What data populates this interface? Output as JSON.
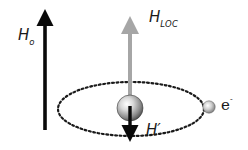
{
  "diagram": {
    "type": "magnetic-shielding-schematic",
    "colors": {
      "background": "#ffffff",
      "applied_field_arrow": "#0a0a0a",
      "local_field_arrow": "#a6a6a6",
      "induced_field_arrow": "#0a0a0a",
      "orbit": "#1a1a1a",
      "nucleus": "#b8b8b8",
      "electron": "#c4c4c4"
    },
    "labels": {
      "applied_field": {
        "main": "H",
        "sub": "o"
      },
      "local_field": {
        "main": "H",
        "sub": "LOC"
      },
      "induced_field": {
        "main": "H′"
      },
      "electron": {
        "main": "e",
        "sup": "-"
      }
    },
    "elements": [
      "applied-field-arrow (black, up)",
      "local-field-arrow (gray, up)",
      "nucleus (sphere)",
      "induced-field-arrow (black, down)",
      "electron-orbit (dotted ellipse)",
      "electron (small sphere)"
    ]
  }
}
